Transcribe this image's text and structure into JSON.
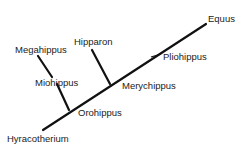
{
  "diagram": {
    "type": "cladogram",
    "title": "",
    "line_color": "#111111",
    "text_color": "#222222",
    "root": "Hyracotherium",
    "taxa": {
      "hyracotherium": "Hyracotherium",
      "orohippus": "Orohippus",
      "miohippus": "Miohippus",
      "megahippus": "Megahippus",
      "merychippus": "Merychippus",
      "hipparon": "Hipparon",
      "pliohippus": "Pliohippus",
      "equus": "Equus"
    },
    "edges": [
      {
        "from": "Hyracotherium",
        "to": "Orohippus"
      },
      {
        "from": "Orohippus",
        "to": "Miohippus"
      },
      {
        "from": "Miohippus",
        "to": "Megahippus"
      },
      {
        "from": "Orohippus",
        "to": "Merychippus"
      },
      {
        "from": "Merychippus",
        "to": "Hipparon"
      },
      {
        "from": "Merychippus",
        "to": "Pliohippus"
      },
      {
        "from": "Pliohippus",
        "to": "Equus"
      }
    ]
  }
}
